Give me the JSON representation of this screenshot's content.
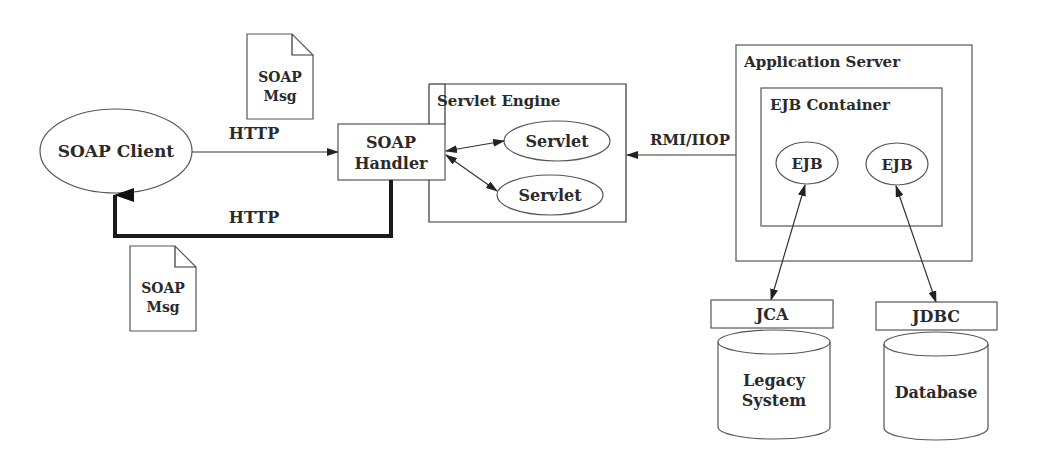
{
  "diagram": {
    "soap_client": {
      "label": "SOAP Client"
    },
    "soap_handler": {
      "line1": "SOAP",
      "line2": "Handler"
    },
    "soap_msg_top": {
      "line1": "SOAP",
      "line2": "Msg"
    },
    "soap_msg_bottom": {
      "line1": "SOAP",
      "line2": "Msg"
    },
    "edges": {
      "request": {
        "label": "HTTP"
      },
      "response": {
        "label": "HTTP"
      },
      "rmi": {
        "label": "RMI/IIOP"
      }
    },
    "servlet_engine": {
      "title": "Servlet Engine",
      "servlets": [
        {
          "label": "Servlet"
        },
        {
          "label": "Servlet"
        }
      ]
    },
    "application_server": {
      "title": "Application Server",
      "ejb_container": {
        "title": "EJB Container",
        "ejbs": [
          {
            "label": "EJB"
          },
          {
            "label": "EJB"
          }
        ]
      }
    },
    "connectors": [
      {
        "label": "JCA"
      },
      {
        "label": "JDBC"
      }
    ],
    "backends": [
      {
        "line1": "Legacy",
        "line2": "System"
      },
      {
        "line1": "Database"
      }
    ],
    "colors": {
      "stroke": "#555555",
      "text": "#2a2a2a",
      "background": "#ffffff"
    }
  }
}
